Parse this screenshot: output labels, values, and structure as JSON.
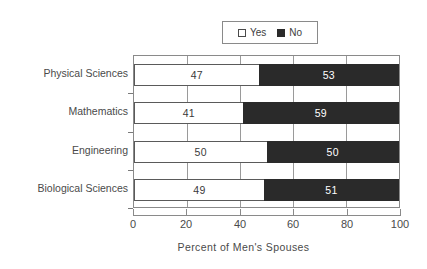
{
  "chart_data": {
    "type": "bar",
    "orientation": "horizontal",
    "stacked": true,
    "stacked_total": 100,
    "title": "",
    "xlabel": "Percent of Men's Spouses",
    "ylabel": "",
    "xlim": [
      0,
      100
    ],
    "xticks": [
      "0",
      "20",
      "40",
      "60",
      "80",
      "100"
    ],
    "xtick_values": [
      0,
      20,
      40,
      60,
      80,
      100
    ],
    "grid": true,
    "grid_axis": "x",
    "legend_position": "top-center",
    "categories": [
      "Physical Sciences",
      "Mathematics",
      "Engineering",
      "Biological Sciences"
    ],
    "series": [
      {
        "name": "Yes",
        "color": "#ffffff",
        "values": [
          47,
          41,
          50,
          49
        ]
      },
      {
        "name": "No",
        "color": "#2a2a2a",
        "values": [
          53,
          59,
          50,
          51
        ]
      }
    ],
    "rows": [
      {
        "category": "Physical Sciences",
        "yes": 47,
        "no": 53
      },
      {
        "category": "Mathematics",
        "yes": 41,
        "no": 59
      },
      {
        "category": "Engineering",
        "yes": 50,
        "no": 50
      },
      {
        "category": "Biological Sciences",
        "yes": 49,
        "no": 51
      }
    ]
  },
  "legend": {
    "entries": [
      {
        "label": "Yes",
        "swatch": "open-square-icon"
      },
      {
        "label": "No",
        "swatch": "filled-square-icon"
      }
    ]
  },
  "colors": {
    "yes_fill": "#ffffff",
    "no_fill": "#2a2a2a",
    "axis": "#8a8a8a",
    "text": "#4a4a4a",
    "grid": "#9a9a9a"
  }
}
